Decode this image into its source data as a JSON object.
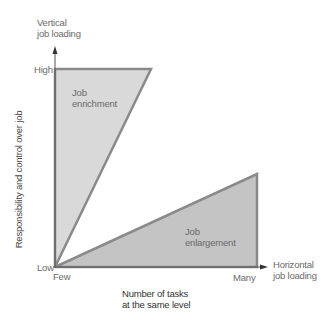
{
  "diagram": {
    "y_axis": {
      "title_line1": "Vertical",
      "title_line2": "job loading",
      "label": "Responsibility and control over job",
      "tick_high": "High",
      "tick_low": "Low"
    },
    "x_axis": {
      "title_line1": "Horizontal",
      "title_line2": "job loading",
      "label_line1": "Number of tasks",
      "label_line2": "at the same level",
      "tick_few": "Few",
      "tick_many": "Many"
    },
    "regions": [
      {
        "name": "enrichment",
        "line1": "Job",
        "line2": "enrichment",
        "fill": "#d9d9d9"
      },
      {
        "name": "enlargement",
        "line1": "Job",
        "line2": "enlargement",
        "fill": "#c4c4c4"
      }
    ],
    "colors": {
      "axis": "#555555",
      "border": "#8a8a8a",
      "background": "#ffffff"
    }
  }
}
